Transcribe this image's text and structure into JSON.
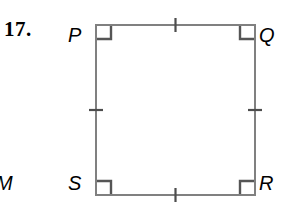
{
  "figure": {
    "problem_number": "17.",
    "adjacent_label": "M",
    "shape": {
      "kind": "quadrilateral",
      "name": "PQRS",
      "stroke_color": "#808080",
      "stroke_width": 2,
      "fill": "none",
      "geometry": {
        "left": 96,
        "top": 25,
        "right": 255,
        "bottom": 195
      }
    },
    "vertices": [
      {
        "id": "P",
        "label": "P",
        "position": "top-left"
      },
      {
        "id": "Q",
        "label": "Q",
        "position": "top-right"
      },
      {
        "id": "R",
        "label": "R",
        "position": "bottom-right"
      },
      {
        "id": "S",
        "label": "S",
        "position": "bottom-left"
      }
    ],
    "right_angle_marks": {
      "count": 4,
      "color": "#555555",
      "size": 14,
      "at": [
        "P",
        "Q",
        "R",
        "S"
      ]
    },
    "congruence_ticks": {
      "count": 4,
      "marks_per_side": 1,
      "color": "#4d4d4d",
      "length": 14,
      "sides": [
        "PQ",
        "QR",
        "RS",
        "SP"
      ]
    }
  }
}
